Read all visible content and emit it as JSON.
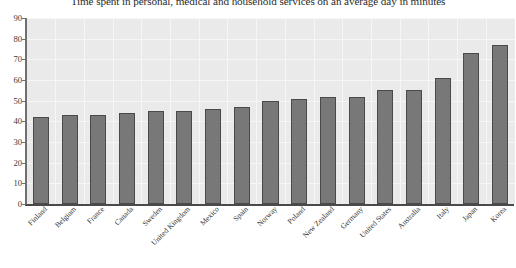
{
  "chart_data": {
    "type": "bar",
    "title": "Time spent in personal, medical and household services on an average day in minutes",
    "xlabel": "",
    "ylabel": "",
    "ylim": [
      0,
      90
    ],
    "ytick_labels": [
      "90",
      "80",
      "70",
      "60",
      "50",
      "40",
      "30",
      "20",
      "10",
      "0"
    ],
    "ytick_values": [
      90,
      80,
      70,
      60,
      50,
      40,
      30,
      20,
      10,
      0
    ],
    "grid": true,
    "legend": "none",
    "bar_color": "#787878",
    "bar_edge_color": "#4a4a4a",
    "plot_background": "#eaeaea",
    "categories": [
      "Finland",
      "Belgium",
      "France",
      "Canada",
      "Sweden",
      "United Kingdom",
      "Mexico",
      "Spain",
      "Norway",
      "Poland",
      "New Zealand",
      "Germany",
      "United States",
      "Australia",
      "Italy",
      "Japan",
      "Korea"
    ],
    "values": [
      42,
      43,
      43,
      44,
      45,
      45,
      46,
      47,
      50,
      51,
      52,
      52,
      55,
      55,
      61,
      73,
      77
    ]
  }
}
